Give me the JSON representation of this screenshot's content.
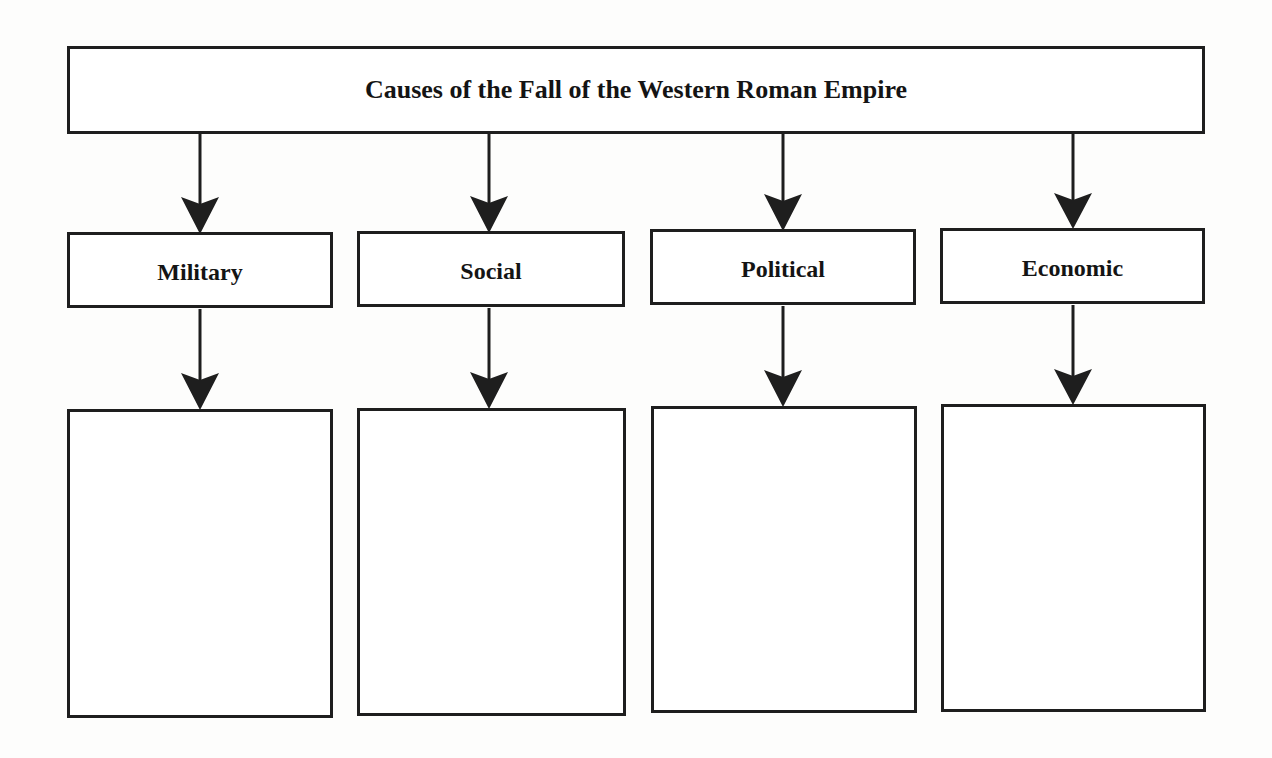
{
  "title": "Causes of the Fall of the Western Roman Empire",
  "categories": [
    {
      "label": "Military",
      "answer": ""
    },
    {
      "label": "Social",
      "answer": ""
    },
    {
      "label": "Political",
      "answer": ""
    },
    {
      "label": "Economic",
      "answer": ""
    }
  ],
  "colors": {
    "line": "#1e1e1e",
    "text": "#141414",
    "background": "#fdfdfc"
  }
}
